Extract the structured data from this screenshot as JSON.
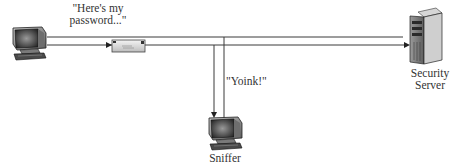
{
  "diagram": {
    "nodes": [
      {
        "id": "client",
        "type": "workstation",
        "icon": "computer-icon",
        "label": ""
      },
      {
        "id": "server",
        "type": "server",
        "icon": "server-icon",
        "label": "Security Server",
        "label_lines": [
          "Security",
          "Server"
        ]
      },
      {
        "id": "sniffer",
        "type": "workstation",
        "icon": "computer-icon",
        "label": "Sniffer"
      }
    ],
    "edges": [
      {
        "from": "client",
        "to": "server",
        "label": "\"Here's my password...\"",
        "payload_icon": "envelope-icon"
      },
      {
        "from": "network",
        "to": "sniffer",
        "label": "\"Yoink!\""
      }
    ],
    "annotations": {
      "client_message_line1": "\"Here's my",
      "client_message_line2": "password...\"",
      "sniffer_message": "\"Yoink!\"",
      "server_label_line1": "Security",
      "server_label_line2": "Server",
      "sniffer_label": "Sniffer"
    },
    "colors": {
      "line": "#3a3a3a",
      "text": "#333333",
      "background": "#ffffff"
    }
  }
}
